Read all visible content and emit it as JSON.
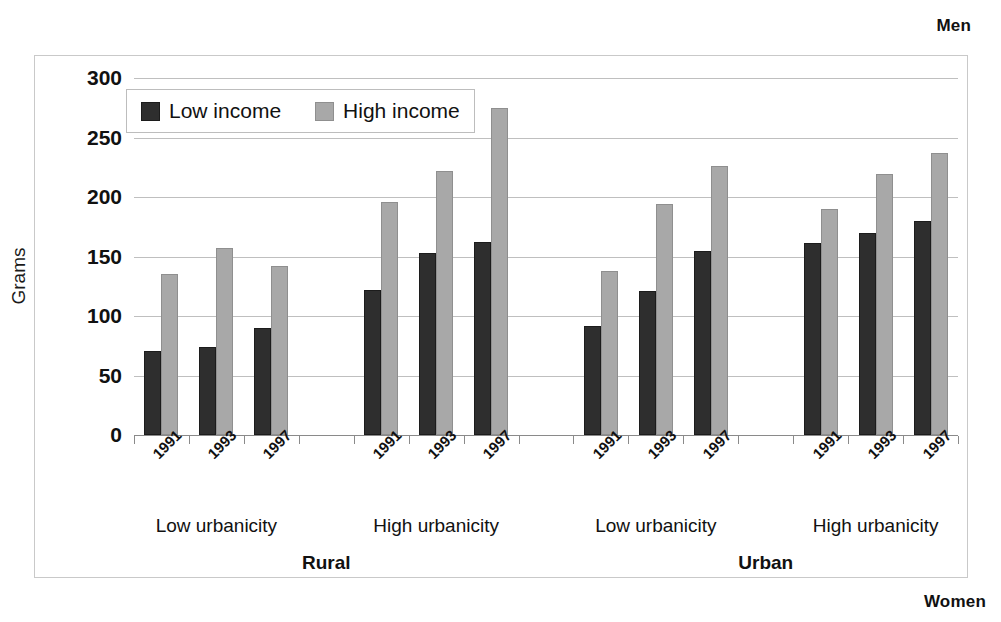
{
  "captions": {
    "top_right": "Men",
    "bottom_right": "Women"
  },
  "legend": {
    "items": [
      {
        "label": "Low income",
        "color": "#2e2e2e",
        "key": "low"
      },
      {
        "label": "High income",
        "color": "#a8a8a8",
        "key": "high"
      }
    ]
  },
  "chart_data": {
    "type": "bar",
    "title": "",
    "xlabel": "",
    "ylabel": "Grams",
    "ylim": [
      0,
      300
    ],
    "yticks": [
      0,
      50,
      100,
      150,
      200,
      250,
      300
    ],
    "ytick_labels": [
      "0",
      "50",
      "100",
      "150",
      "200",
      "250",
      "300"
    ],
    "grid": true,
    "legend_position": "top-left-inside",
    "categories": [
      "1991",
      "1993",
      "1997"
    ],
    "series": [
      {
        "name": "Low income",
        "color": "#2e2e2e"
      },
      {
        "name": "High income",
        "color": "#a8a8a8"
      }
    ],
    "groups": [
      {
        "area": "Rural",
        "urbanicity": "Low urbanicity",
        "years": [
          "1991",
          "1993",
          "1997"
        ],
        "low_income": [
          71,
          74,
          90
        ],
        "high_income": [
          135,
          157,
          142
        ]
      },
      {
        "area": "Rural",
        "urbanicity": "High urbanicity",
        "years": [
          "1991",
          "1993",
          "1997"
        ],
        "low_income": [
          122,
          153,
          162
        ],
        "high_income": [
          196,
          222,
          275
        ]
      },
      {
        "area": "Urban",
        "urbanicity": "Low urbanicity",
        "years": [
          "1991",
          "1993",
          "1997"
        ],
        "low_income": [
          92,
          121,
          155
        ],
        "high_income": [
          138,
          194,
          226
        ]
      },
      {
        "area": "Urban",
        "urbanicity": "High urbanicity",
        "years": [
          "1991",
          "1993",
          "1997"
        ],
        "low_income": [
          161,
          170,
          180
        ],
        "high_income": [
          190,
          219,
          237
        ]
      }
    ],
    "area_labels": [
      "Rural",
      "Urban"
    ]
  }
}
